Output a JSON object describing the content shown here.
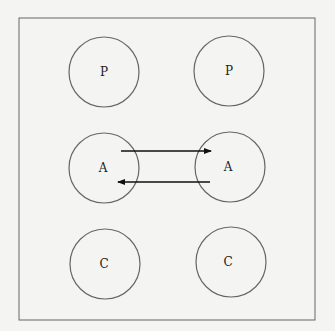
{
  "diagram": {
    "background": "#f4f4f2",
    "frame": {
      "x": 19,
      "y": 18,
      "width": 296,
      "height": 302,
      "stroke": "#666666"
    },
    "nodes": [
      {
        "id": "p-left",
        "label": "P",
        "cx": 104,
        "cy": 72,
        "r": 35
      },
      {
        "id": "p-right",
        "label": "P",
        "cx": 229,
        "cy": 71,
        "r": 35
      },
      {
        "id": "a-left",
        "label": "A",
        "cx": 104,
        "cy": 168,
        "r": 35
      },
      {
        "id": "a-right",
        "label": "A",
        "cx": 230,
        "cy": 167,
        "r": 35
      },
      {
        "id": "c-left",
        "label": "C",
        "cx": 105,
        "cy": 264,
        "r": 35
      },
      {
        "id": "c-right",
        "label": "C",
        "cx": 231,
        "cy": 262,
        "r": 35
      }
    ],
    "edges": [
      {
        "from": "a-left",
        "to": "a-right",
        "x1": 121,
        "y1": 151,
        "x2": 211,
        "y2": 151
      },
      {
        "from": "a-right",
        "to": "a-left",
        "x1": 210,
        "y1": 182,
        "x2": 118,
        "y2": 182
      }
    ]
  }
}
